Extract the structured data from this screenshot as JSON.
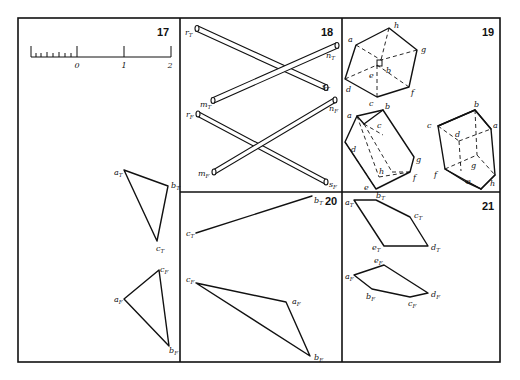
{
  "sheet": {
    "frame": {
      "left": 18,
      "top": 18,
      "right": 500,
      "bottom": 362
    },
    "dividers": {
      "v1": 180,
      "v2": 342,
      "h": 192
    }
  },
  "panels": [
    {
      "number": "17",
      "scale": {
        "labels": [
          "0",
          "1",
          "2"
        ]
      },
      "labels": [
        {
          "base": "a",
          "sub": "T"
        },
        {
          "base": "b",
          "sub": "T"
        },
        {
          "base": "c",
          "sub": "T"
        },
        {
          "base": "a",
          "sub": "F"
        },
        {
          "base": "b",
          "sub": "F"
        },
        {
          "base": "c",
          "sub": "F"
        }
      ]
    },
    {
      "number": "18",
      "labels": [
        {
          "base": "r",
          "sub": "T"
        },
        {
          "base": "n",
          "sub": "T"
        },
        {
          "base": "s",
          "sub": "T"
        },
        {
          "base": "m",
          "sub": "T"
        },
        {
          "base": "r",
          "sub": "F"
        },
        {
          "base": "n",
          "sub": "F"
        },
        {
          "base": "s",
          "sub": "F"
        },
        {
          "base": "m",
          "sub": "F"
        }
      ]
    },
    {
      "number": "19",
      "labels": [
        {
          "base": "a",
          "sub": "T"
        },
        {
          "base": "h",
          "sub": "T"
        },
        {
          "base": "g",
          "sub": "T"
        },
        {
          "base": "b",
          "sub": "T"
        },
        {
          "base": "e",
          "sub": "T"
        },
        {
          "base": "d",
          "sub": "T"
        },
        {
          "base": "c",
          "sub": "T"
        },
        {
          "base": "f",
          "sub": "T"
        },
        {
          "base": "a",
          "sub": "F"
        },
        {
          "base": "b",
          "sub": "F"
        },
        {
          "base": "c",
          "sub": "F"
        },
        {
          "base": "d",
          "sub": "F"
        },
        {
          "base": "g",
          "sub": "F"
        },
        {
          "base": "h",
          "sub": "F"
        },
        {
          "base": "f",
          "sub": "F"
        },
        {
          "base": "e",
          "sub": "F"
        },
        {
          "base": "b",
          "sub": "R"
        },
        {
          "base": "c",
          "sub": "R"
        },
        {
          "base": "a",
          "sub": "R"
        },
        {
          "base": "d",
          "sub": "R"
        },
        {
          "base": "g",
          "sub": "R"
        },
        {
          "base": "f",
          "sub": "R"
        },
        {
          "base": "e",
          "sub": "R"
        },
        {
          "base": "h",
          "sub": "R"
        }
      ]
    },
    {
      "number": "20",
      "labels": [
        {
          "base": "b",
          "sub": "T"
        },
        {
          "base": "c",
          "sub": "T"
        },
        {
          "base": "c",
          "sub": "F"
        },
        {
          "base": "a",
          "sub": "F"
        },
        {
          "base": "b",
          "sub": "F"
        }
      ]
    },
    {
      "number": "21",
      "labels": [
        {
          "base": "a",
          "sub": "T"
        },
        {
          "base": "b",
          "sub": "T"
        },
        {
          "base": "c",
          "sub": "T"
        },
        {
          "base": "d",
          "sub": "T"
        },
        {
          "base": "e",
          "sub": "T"
        },
        {
          "base": "e",
          "sub": "F"
        },
        {
          "base": "a",
          "sub": "F"
        },
        {
          "base": "b",
          "sub": "F"
        },
        {
          "base": "c",
          "sub": "F"
        },
        {
          "base": "d",
          "sub": "F"
        }
      ]
    }
  ]
}
